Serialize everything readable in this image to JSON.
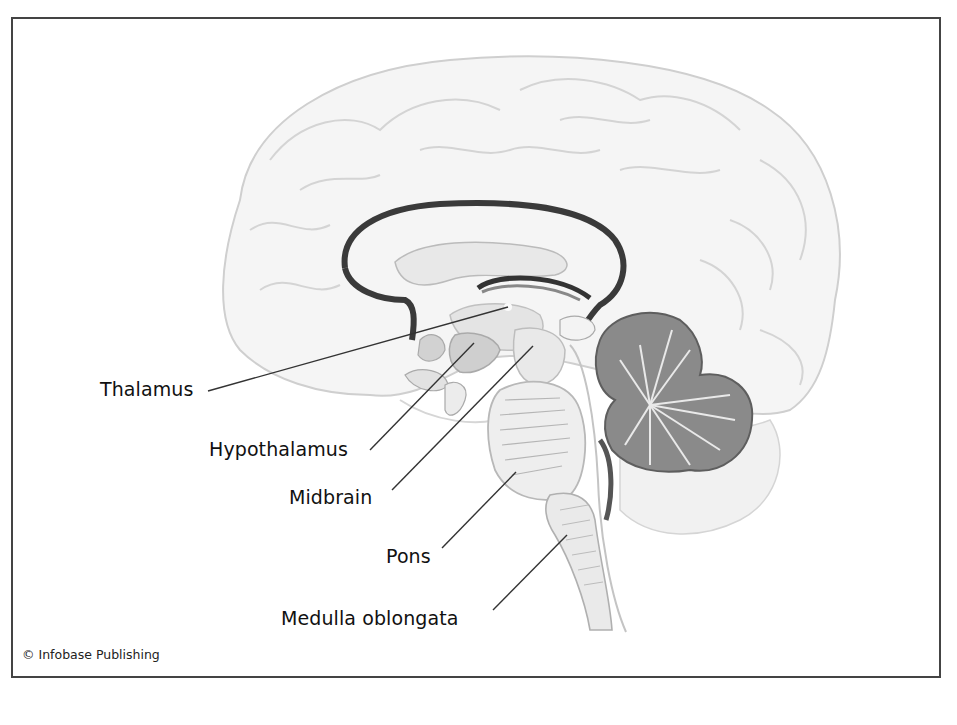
{
  "figure": {
    "labels": [
      {
        "id": "thalamus",
        "text": "Thalamus"
      },
      {
        "id": "hypothalamus",
        "text": "Hypothalamus"
      },
      {
        "id": "midbrain",
        "text": "Midbrain"
      },
      {
        "id": "pons",
        "text": "Pons"
      },
      {
        "id": "medulla",
        "text": "Medulla oblongata"
      }
    ],
    "credit": "© Infobase Publishing"
  },
  "colors": {
    "frame": "#444444",
    "cortex_fill": "#f4f4f4",
    "cortex_stroke": "#c8c8c8",
    "ventricle": "#3a3a3a",
    "cerebellum": "#8a8a8a",
    "brainstem": "#e6e6e6",
    "text": "#111111"
  }
}
